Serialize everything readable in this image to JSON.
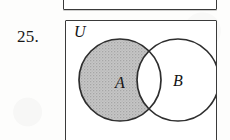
{
  "exercise": {
    "number": "25."
  },
  "previous_figure": {
    "name": "partial-box-above"
  },
  "figure": {
    "universe_label": "U",
    "set_a_label": "A",
    "set_b_label": "B",
    "shaded_region": "A minus B",
    "colors": {
      "shading": "#bdbdbd",
      "outline": "#2e2e2e",
      "box_border": "#3a3a3a",
      "page": "#fdfdfc",
      "circle_fill": "#ffffff"
    },
    "geometry": {
      "circle_a_cx": 54,
      "circle_a_cy": 59,
      "circle_a_r": 41,
      "circle_b_cx": 112,
      "circle_b_cy": 59,
      "circle_b_r": 41
    }
  }
}
